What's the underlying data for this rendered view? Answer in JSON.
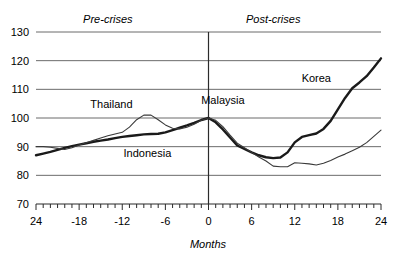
{
  "chart_data": {
    "type": "line",
    "title": "",
    "xlabel": "Months",
    "ylabel": "",
    "xlim": [
      -24,
      24
    ],
    "ylim": [
      70,
      130
    ],
    "grid": true,
    "legend": "inline-annotations",
    "x_ticks": [
      -24,
      -18,
      -12,
      -6,
      0,
      6,
      12,
      18,
      24
    ],
    "x_tick_labels": [
      "24",
      "-18",
      "-12",
      "-6",
      "0",
      "6",
      "12",
      "18",
      "24"
    ],
    "minor_x_tick_interval": 1,
    "y_ticks": [
      70,
      80,
      90,
      100,
      110,
      120,
      130
    ],
    "y_tick_labels": [
      "70",
      "80",
      "90",
      "100",
      "110",
      "120",
      "130"
    ],
    "crisis_marker_x": 0,
    "annotations": [
      {
        "text": "Pre-crises",
        "x": -14,
        "y": 133,
        "style": "italic"
      },
      {
        "text": "Post-crises",
        "x": 9,
        "y": 133,
        "style": "italic"
      },
      {
        "text": "Thailand",
        "x": -13.5,
        "y": 103.5,
        "style": "normal"
      },
      {
        "text": "Indonesia",
        "x": -8.5,
        "y": 86.5,
        "style": "normal"
      },
      {
        "text": "Malaysia",
        "x": 2.0,
        "y": 105.0,
        "style": "normal"
      },
      {
        "text": "Korea",
        "x": 15.0,
        "y": 112.5,
        "style": "normal"
      }
    ],
    "x": [
      -24,
      -23,
      -22,
      -21,
      -20,
      -19,
      -18,
      -17,
      -16,
      -15,
      -14,
      -13,
      -12,
      -11,
      -10,
      -9,
      -8,
      -7,
      -6,
      -5,
      -4,
      -3,
      -2,
      -1,
      0,
      1,
      2,
      3,
      4,
      5,
      6,
      7,
      8,
      9,
      10,
      11,
      12,
      13,
      14,
      15,
      16,
      17,
      18,
      19,
      20,
      21,
      22,
      23,
      24
    ],
    "series": [
      {
        "name": "Korea",
        "style": "thick",
        "values": [
          87.0,
          87.6,
          88.2,
          88.9,
          89.6,
          90.2,
          90.7,
          91.2,
          91.7,
          92.1,
          92.5,
          93.0,
          93.4,
          93.7,
          94.0,
          94.3,
          94.4,
          94.5,
          95.0,
          95.8,
          96.6,
          97.4,
          98.3,
          99.3,
          100.0,
          98.5,
          96.0,
          93.2,
          90.4,
          89.2,
          88.0,
          87.0,
          86.3,
          86.0,
          86.2,
          88.0,
          91.5,
          93.4,
          94.0,
          94.6,
          96.2,
          99.0,
          103.0,
          107.0,
          110.4,
          112.4,
          114.6,
          117.6,
          120.8
        ]
      },
      {
        "name": "Indonesia-Thailand-Malaysia",
        "style": "thin",
        "values": [
          90.0,
          90.0,
          89.8,
          89.4,
          89.0,
          89.6,
          90.6,
          91.4,
          92.2,
          93.0,
          93.8,
          94.4,
          95.0,
          96.8,
          99.4,
          101.0,
          101.0,
          99.4,
          97.6,
          96.4,
          96.2,
          96.8,
          97.8,
          99.2,
          100.0,
          99.2,
          97.0,
          94.0,
          91.2,
          89.6,
          88.0,
          86.4,
          85.0,
          83.2,
          83.0,
          83.0,
          84.4,
          84.2,
          84.0,
          83.6,
          84.2,
          85.2,
          86.4,
          87.4,
          88.6,
          89.8,
          91.4,
          93.6,
          95.8
        ]
      }
    ]
  }
}
